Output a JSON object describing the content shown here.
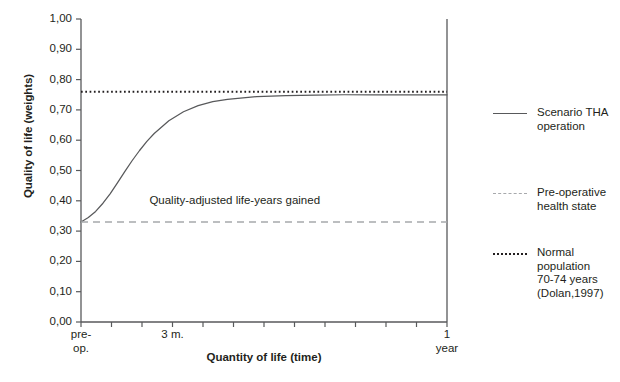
{
  "chart_data": {
    "type": "line",
    "title": "",
    "xlabel": "Quantity of life (time)",
    "ylabel": "Quality of life (weights)",
    "ylim": [
      0.0,
      1.0
    ],
    "y_ticks": [
      "1,00",
      "0,90",
      "0,80",
      "0,70",
      "0,60",
      "0,50",
      "0,40",
      "0,30",
      "0,20",
      "0,10",
      "0,00"
    ],
    "y_tick_values": [
      1.0,
      0.9,
      0.8,
      0.7,
      0.6,
      0.5,
      0.4,
      0.3,
      0.2,
      0.1,
      0.0
    ],
    "x_tick_count": 13,
    "x_tick_labels": [
      {
        "index": 0,
        "label": "pre-\nop."
      },
      {
        "index": 3,
        "label": "3 m."
      },
      {
        "index": 12,
        "label": "1\nyear"
      }
    ],
    "grid": false,
    "legend_position": "right",
    "annotations": [
      {
        "text": "Quality-adjusted life-years gained",
        "x_frac": 0.42,
        "y_value": 0.4
      }
    ],
    "series": [
      {
        "name": "Scenario THA operation",
        "style": "solid",
        "color": "#58595b",
        "x": [
          0.0,
          0.02,
          0.04,
          0.06,
          0.08,
          0.1,
          0.12,
          0.14,
          0.16,
          0.18,
          0.2,
          0.24,
          0.28,
          0.32,
          0.36,
          0.4,
          0.48,
          0.56,
          0.64,
          0.72,
          0.8,
          0.9,
          1.0
        ],
        "values": [
          0.33,
          0.345,
          0.365,
          0.392,
          0.424,
          0.46,
          0.497,
          0.533,
          0.566,
          0.596,
          0.622,
          0.664,
          0.694,
          0.714,
          0.727,
          0.735,
          0.744,
          0.747,
          0.749,
          0.75,
          0.75,
          0.75,
          0.75
        ]
      },
      {
        "name": "Pre-operative health state",
        "style": "dashed",
        "color": "#a7a9ac",
        "constant_value": 0.33
      },
      {
        "name": "Normal population 70-74 years (Dolan,1997)",
        "style": "dotted",
        "color": "#231f20",
        "constant_value": 0.76
      }
    ]
  },
  "legend": {
    "items": [
      {
        "label": "Scenario THA\noperation",
        "style": "solid",
        "color": "#58595b"
      },
      {
        "label": "Pre-operative\nhealth state",
        "style": "dashed",
        "color": "#a7a9ac"
      },
      {
        "label": "Normal population\n70-74 years\n(Dolan,1997)",
        "style": "dotted",
        "color": "#231f20"
      }
    ]
  },
  "axis": {
    "line_color": "#58595b"
  }
}
